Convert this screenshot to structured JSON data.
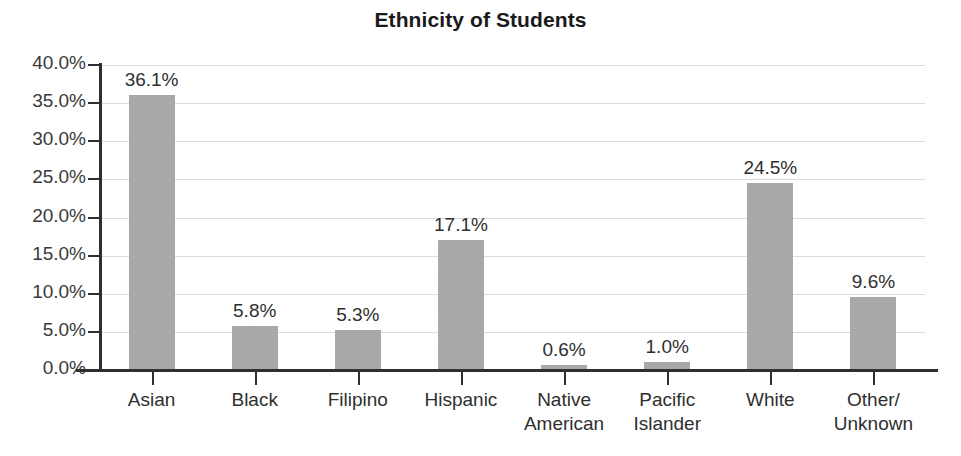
{
  "chart_data": {
    "type": "bar",
    "title": "Ethnicity of Students",
    "xlabel": "",
    "ylabel": "",
    "categories": [
      "Asian",
      "Black",
      "Filipino",
      "Hispanic",
      "Native\nAmerican",
      "Pacific\nIslander",
      "White",
      "Other/\nUnknown"
    ],
    "values": [
      36.1,
      5.8,
      5.3,
      17.1,
      0.6,
      1.0,
      24.5,
      9.6
    ],
    "value_labels": [
      "36.1%",
      "5.8%",
      "5.3%",
      "17.1%",
      "0.6%",
      "1.0%",
      "24.5%",
      "9.6%"
    ],
    "ylim": [
      0,
      40
    ],
    "ytick_values": [
      0,
      5,
      10,
      15,
      20,
      25,
      30,
      35,
      40
    ],
    "ytick_labels": [
      "0.0%",
      "5.0%",
      "10.0%",
      "15.0%",
      "20.0%",
      "25.0%",
      "30.0%",
      "35.0%",
      "40.0%"
    ],
    "grid": true,
    "legend": false,
    "bar_color": "#a9a9a9",
    "axis_color": "#2f2f2f",
    "gridline_color": "#dcdcdc",
    "text_color": "#2f2f2f"
  }
}
